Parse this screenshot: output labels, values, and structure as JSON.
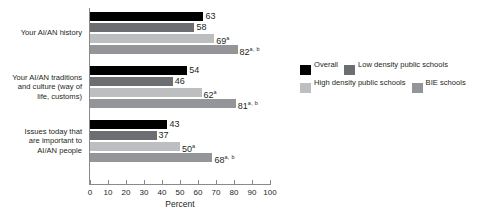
{
  "chart_data": {
    "type": "bar",
    "orientation": "horizontal",
    "title": "",
    "xlabel": "Percent",
    "ylabel": "",
    "xlim": [
      0,
      100
    ],
    "xticks": [
      0,
      10,
      20,
      30,
      40,
      50,
      60,
      70,
      80,
      90,
      100
    ],
    "grid": false,
    "legend_position": "right",
    "categories": [
      "Your AI/AN history",
      "Your AI/AN traditions and culture (way of life, customs)",
      "Issues today that are important to AI/AN people"
    ],
    "category_lines": [
      [
        "Your AI/AN history"
      ],
      [
        "Your AI/AN traditions",
        "and culture (way of",
        "life, customs)"
      ],
      [
        "Issues today that",
        "are important to",
        "AI/AN people"
      ]
    ],
    "series": [
      {
        "name": "Overall",
        "color": "#000000",
        "values": [
          63,
          54,
          43
        ],
        "labels": [
          "63",
          "54",
          "43"
        ],
        "marks": [
          "",
          "",
          ""
        ]
      },
      {
        "name": "Low density public schools",
        "color": "#6d6e71",
        "values": [
          58,
          46,
          37
        ],
        "labels": [
          "58",
          "46",
          "37"
        ],
        "marks": [
          "",
          "",
          ""
        ]
      },
      {
        "name": "High density public schools",
        "color": "#bcbec0",
        "values": [
          69,
          62,
          50
        ],
        "labels": [
          "69",
          "62",
          "50"
        ],
        "marks": [
          "a",
          "a",
          "a"
        ]
      },
      {
        "name": "BIE schools",
        "color": "#939598",
        "values": [
          82,
          81,
          68
        ],
        "labels": [
          "82",
          "81",
          "68"
        ],
        "marks": [
          "a, b",
          "a, b",
          "a, b"
        ]
      }
    ]
  },
  "legend": {
    "row1": [
      {
        "label": "Overall",
        "color": "#000000"
      },
      {
        "label": "Low density public schools",
        "color": "#6d6e71"
      }
    ],
    "row2": [
      {
        "label": "High density public schools",
        "color": "#bcbec0"
      },
      {
        "label": "BIE schools",
        "color": "#939598"
      }
    ]
  },
  "axis": {
    "x_title": "Percent",
    "tick_labels": [
      "0",
      "10",
      "20",
      "30",
      "40",
      "50",
      "60",
      "70",
      "80",
      "90",
      "100"
    ]
  }
}
